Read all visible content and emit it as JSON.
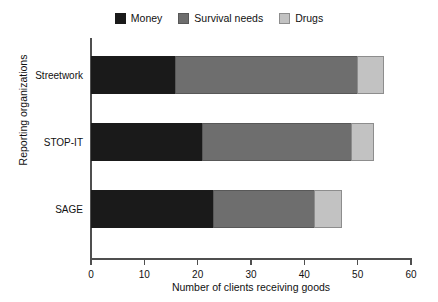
{
  "chart_data": {
    "type": "bar",
    "orientation": "horizontal",
    "stacked": true,
    "title": "",
    "xlabel": "Number of clients receiving goods",
    "ylabel": "Reporting organizations",
    "categories": [
      "Streetwork",
      "STOP-IT",
      "SAGE"
    ],
    "series": [
      {
        "name": "Money",
        "color": "#1a1a1a",
        "values": [
          16,
          21,
          23
        ]
      },
      {
        "name": "Survival needs",
        "color": "#6e6e6e",
        "values": [
          34,
          28,
          19
        ]
      },
      {
        "name": "Drugs",
        "color": "#c2c2c2",
        "values": [
          5,
          4,
          5
        ]
      }
    ],
    "totals": [
      55,
      53,
      47
    ],
    "xlim": [
      0,
      60
    ],
    "xticks": [
      0,
      10,
      20,
      30,
      40,
      50,
      60
    ],
    "xtick_labels": [
      "0",
      "10",
      "20",
      "30",
      "40",
      "50",
      "60"
    ],
    "grid": false,
    "legend_position": "top-center"
  },
  "legend": {
    "items": [
      {
        "label": "Money",
        "swatch_name": "legend-swatch-money"
      },
      {
        "label": "Survival needs",
        "swatch_name": "legend-swatch-survival-needs"
      },
      {
        "label": "Drugs",
        "swatch_name": "legend-swatch-drugs"
      }
    ]
  }
}
